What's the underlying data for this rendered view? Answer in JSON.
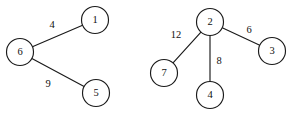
{
  "figure": {
    "background_color": "#ffffff",
    "stroke_color": "#1a1a1a",
    "text_color": "#101010",
    "width": 298,
    "height": 114
  },
  "chart_data": {
    "type": "diagram",
    "diagram_kind": "weighted-undirected-graph",
    "title": "",
    "components": [
      {
        "name": "left-component",
        "node_ids": [
          "6",
          "1",
          "5"
        ]
      },
      {
        "name": "right-component",
        "node_ids": [
          "2",
          "7",
          "4",
          "3"
        ]
      }
    ],
    "nodes": [
      {
        "id": "n6",
        "label": "6",
        "cx": 20,
        "cy": 52,
        "r": 13.5,
        "component": "left-component"
      },
      {
        "id": "n1",
        "label": "1",
        "cx": 95,
        "cy": 20,
        "r": 13.5,
        "component": "left-component"
      },
      {
        "id": "n5",
        "label": "5",
        "cx": 96,
        "cy": 93,
        "r": 13.5,
        "component": "left-component"
      },
      {
        "id": "n2",
        "label": "2",
        "cx": 210,
        "cy": 22,
        "r": 13.5,
        "component": "right-component"
      },
      {
        "id": "n7",
        "label": "7",
        "cx": 164,
        "cy": 73,
        "r": 13.5,
        "component": "right-component"
      },
      {
        "id": "n4",
        "label": "4",
        "cx": 210,
        "cy": 95,
        "r": 13.5,
        "component": "right-component"
      },
      {
        "id": "n3",
        "label": "3",
        "cx": 272,
        "cy": 51,
        "r": 13.5,
        "component": "right-component"
      }
    ],
    "edges": [
      {
        "id": "e6-1",
        "source": "n6",
        "target": "n1",
        "weight": "4",
        "label_x": 52,
        "label_y": 26
      },
      {
        "id": "e6-5",
        "source": "n6",
        "target": "n5",
        "weight": "9",
        "label_x": 48,
        "label_y": 85
      },
      {
        "id": "e2-7",
        "source": "n2",
        "target": "n7",
        "weight": "12",
        "label_x": 176,
        "label_y": 36
      },
      {
        "id": "e2-4",
        "source": "n2",
        "target": "n4",
        "weight": "8",
        "label_x": 219,
        "label_y": 62
      },
      {
        "id": "e2-3",
        "source": "n2",
        "target": "n3",
        "weight": "6",
        "label_x": 249,
        "label_y": 31
      }
    ]
  }
}
